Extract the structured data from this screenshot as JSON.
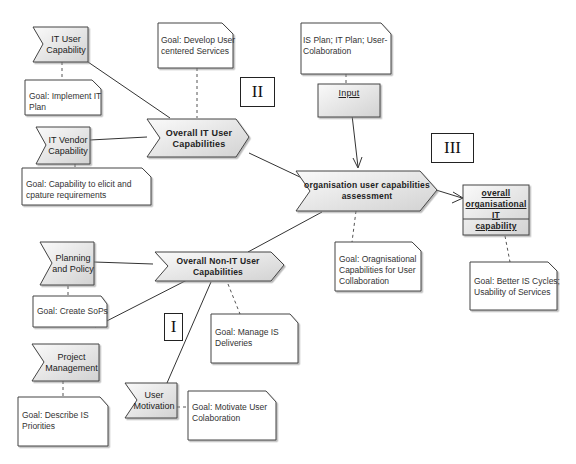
{
  "diagram": {
    "markers": [
      {
        "id": "I",
        "label": "I"
      },
      {
        "id": "II",
        "label": "II"
      },
      {
        "id": "III",
        "label": "III"
      }
    ],
    "inputs": {
      "it_user_capability": {
        "line1": "IT User",
        "line2": "Capability"
      },
      "it_vendor_capability": {
        "line1": "IT Vendor",
        "line2": "Capability"
      },
      "planning_policy": {
        "line1": "Planning",
        "line2": "and Policy"
      },
      "project_management": {
        "line1": "Project",
        "line2": "Management"
      },
      "user_motivation": {
        "line1": "User",
        "line2": "Motivation"
      }
    },
    "processes": {
      "overall_it": {
        "line1": "Overall IT User",
        "line2": "Capabilities"
      },
      "overall_non_it": {
        "line1": "Overall Non-IT User Capabilities"
      },
      "assessment": {
        "line1": "organisation user capabilities",
        "line2": "assessment"
      }
    },
    "data_objects": {
      "input": {
        "label": "Input"
      },
      "output": {
        "line1": "overall",
        "line2": "organisational IT",
        "line3": "capability"
      }
    },
    "notes": {
      "implement_it": {
        "line1": "Goal: Implement IT",
        "line2": "Plan"
      },
      "develop_user": {
        "line1": "Goal: Develop User",
        "line2": "centered Services"
      },
      "is_plan": {
        "line1": "IS Plan; IT Plan; User-",
        "line2": "Colaboration"
      },
      "elicit": {
        "line1": "Goal: Capability to elicit and",
        "line2": "cpature requirements"
      },
      "create_sops": {
        "line1": "Goal: Create SoPs"
      },
      "manage_is": {
        "line1": "Goal: Manage IS",
        "line2": "Deliveries"
      },
      "org_cap": {
        "line1": "Goal: Oragnisational",
        "line2": "Capabilities for User",
        "line3": "Collaboration"
      },
      "better_is": {
        "line1": "Goal: Better IS Cycles;",
        "line2": "Usability of Services"
      },
      "describe_is": {
        "line1": "Goal: Describe IS",
        "line2": "Priorities"
      },
      "motivate": {
        "line1": "Goal: Motivate User",
        "line2": "Colaboration"
      }
    },
    "colors": {
      "shape_fill_light": "#f4f4f4",
      "shape_fill_dark": "#d6d6d6",
      "stroke": "#444444",
      "note_fill": "#ffffff"
    }
  }
}
